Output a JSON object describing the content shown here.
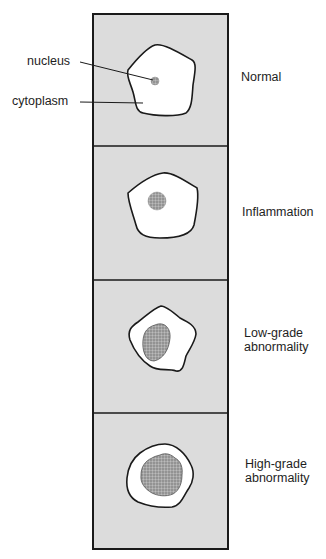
{
  "callouts": {
    "nucleus": "nucleus",
    "cytoplasm": "cytoplasm"
  },
  "panels": [
    {
      "label_line1": "Normal",
      "label_line2": "",
      "nucleus_size": "small"
    },
    {
      "label_line1": "Inflammation",
      "label_line2": "",
      "nucleus_size": "small-medium"
    },
    {
      "label_line1": "Low-grade",
      "label_line2": "abnormality",
      "nucleus_size": "large"
    },
    {
      "label_line1": "High-grade",
      "label_line2": "abnormality",
      "nucleus_size": "very large"
    }
  ],
  "colors": {
    "panel_fill": "#dcdcdc",
    "cell_fill": "#ffffff",
    "outline": "#1a1a1a",
    "nucleus_fill": "#9a9a9a"
  }
}
